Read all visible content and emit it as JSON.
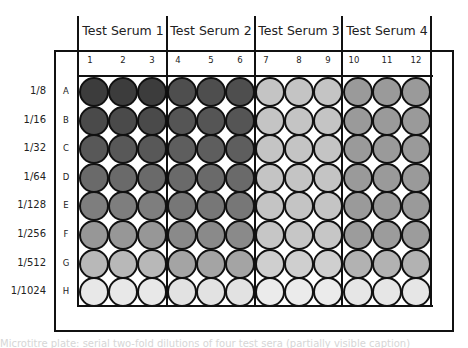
{
  "plate": {
    "serum_groups": [
      {
        "label": "Test Serum 1",
        "columns": [
          "1",
          "2",
          "3"
        ]
      },
      {
        "label": "Test Serum 2",
        "columns": [
          "4",
          "5",
          "6"
        ]
      },
      {
        "label": "Test Serum 3",
        "columns": [
          "7",
          "8",
          "9"
        ]
      },
      {
        "label": "Test Serum 4",
        "columns": [
          "10",
          "11",
          "12"
        ]
      }
    ],
    "rows": [
      {
        "letter": "A",
        "dilution": "1/8"
      },
      {
        "letter": "B",
        "dilution": "1/16"
      },
      {
        "letter": "C",
        "dilution": "1/32"
      },
      {
        "letter": "D",
        "dilution": "1/64"
      },
      {
        "letter": "E",
        "dilution": "1/128"
      },
      {
        "letter": "F",
        "dilution": "1/256"
      },
      {
        "letter": "G",
        "dilution": "1/512"
      },
      {
        "letter": "H",
        "dilution": "1/1024"
      }
    ],
    "well_colors_by_group": [
      [
        "#3c3c3c",
        "#4a4a4a",
        "#585858",
        "#6a6a6a",
        "#7e7e7e",
        "#979797",
        "#b8b8b8",
        "#e8e8e8"
      ],
      [
        "#4e4e4e",
        "#555555",
        "#5e5e5e",
        "#6a6a6a",
        "#777777",
        "#8a8a8a",
        "#a4a4a4",
        "#e2e2e2"
      ],
      [
        "#c4c4c4",
        "#c4c4c4",
        "#c4c4c4",
        "#c4c4c4",
        "#c4c4c4",
        "#c6c6c6",
        "#cfcfcf",
        "#ebebeb"
      ],
      [
        "#9a9a9a",
        "#9a9a9a",
        "#9a9a9a",
        "#9a9a9a",
        "#9a9a9a",
        "#9c9c9c",
        "#b2b2b2",
        "#e6e6e6"
      ]
    ]
  },
  "footer": {
    "text": "Microtitre plate: serial two-fold dilutions of four test sera (partially visible caption)"
  }
}
